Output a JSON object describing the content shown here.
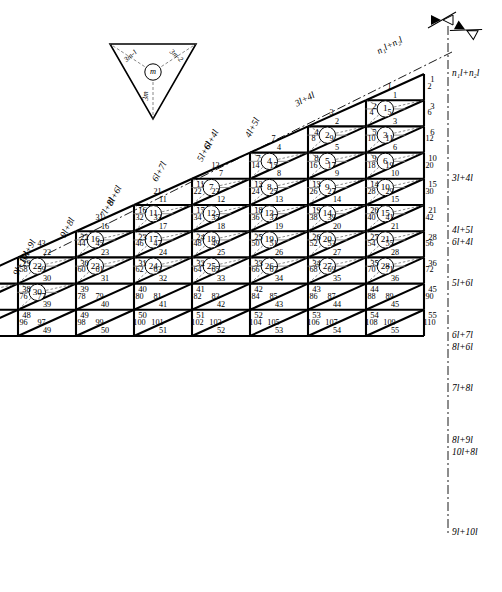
{
  "figure": {
    "caption": "",
    "type": "engineering-diagram"
  },
  "legend": {
    "name": "unit-cell-key",
    "center_label": "m",
    "edge_left": "3m-1",
    "edge_right": "3m-2",
    "edge_bottom": "3m"
  },
  "supports": {
    "symbol": "pin-roller-support",
    "count": 2
  },
  "dimensions_right": [
    "n₁l+n₂l",
    "3l+4l",
    "4l+5l",
    "6l+4l",
    "5l+6l",
    "6l+7l",
    "8l+6l",
    "7l+8l",
    "8l+9l",
    "10l+8l",
    "9l+10l"
  ],
  "dimensions_diagonal": [
    "n₁l+n₂l",
    "3l+4l",
    "4l+5l",
    "6l+4l",
    "5l+6l",
    "6l+7l",
    "8l+6l",
    "7l+8l",
    "10l+9l",
    "9l+10l"
  ],
  "cells": [
    {
      "id": "1",
      "x": 395,
      "y": 100
    },
    {
      "id": "2",
      "x": 366,
      "y": 152
    },
    {
      "id": "3",
      "x": 308,
      "y": 152
    },
    {
      "id": "4",
      "x": 395,
      "y": 205
    },
    {
      "id": "5",
      "x": 279,
      "y": 205
    },
    {
      "id": "6",
      "x": 337,
      "y": 205
    },
    {
      "id": "7",
      "x": 395,
      "y": 205
    },
    {
      "id": "8",
      "x": 221,
      "y": 205
    },
    {
      "id": "9",
      "x": 308,
      "y": 257
    },
    {
      "id": "10",
      "x": 424,
      "y": 257
    },
    {
      "id": "11",
      "x": 192,
      "y": 257
    },
    {
      "id": "12",
      "x": 250,
      "y": 257
    },
    {
      "id": "13",
      "x": 337,
      "y": 310
    },
    {
      "id": "14",
      "x": 395,
      "y": 310
    },
    {
      "id": "15",
      "x": 134,
      "y": 257
    },
    {
      "id": "16",
      "x": 221,
      "y": 310
    },
    {
      "id": "17",
      "x": 279,
      "y": 362
    },
    {
      "id": "18",
      "x": 337,
      "y": 362
    },
    {
      "id": "19",
      "x": 424,
      "y": 362
    },
    {
      "id": "20",
      "x": 105,
      "y": 310
    },
    {
      "id": "21",
      "x": 163,
      "y": 310
    },
    {
      "id": "22",
      "x": 250,
      "y": 415
    },
    {
      "id": "23",
      "x": 366,
      "y": 415
    },
    {
      "id": "24",
      "x": 424,
      "y": 415
    },
    {
      "id": "25",
      "x": 76,
      "y": 362
    },
    {
      "id": "26",
      "x": 134,
      "y": 362
    },
    {
      "id": "27",
      "x": 192,
      "y": 415
    },
    {
      "id": "28",
      "x": 221,
      "y": 467
    },
    {
      "id": "29",
      "x": 308,
      "y": 467
    },
    {
      "id": "30",
      "x": 424,
      "y": 467
    }
  ],
  "node_numbers": [
    "1",
    "2",
    "3",
    "4",
    "5",
    "6",
    "7",
    "8",
    "9",
    "10",
    "11",
    "12",
    "13",
    "14",
    "15",
    "16",
    "17",
    "18",
    "19",
    "20",
    "21",
    "22",
    "23",
    "24",
    "25",
    "26",
    "27",
    "28",
    "29",
    "30",
    "31",
    "32",
    "33",
    "34",
    "35",
    "36",
    "37",
    "38",
    "39",
    "40",
    "41",
    "42",
    "43",
    "44",
    "45",
    "46",
    "47",
    "48",
    "49",
    "50",
    "51",
    "52",
    "53",
    "54",
    "55"
  ],
  "member_numbers_max": 145,
  "colors": {
    "line": "#000000",
    "dash": "#555555",
    "thin": "#666666",
    "background": "#ffffff"
  }
}
